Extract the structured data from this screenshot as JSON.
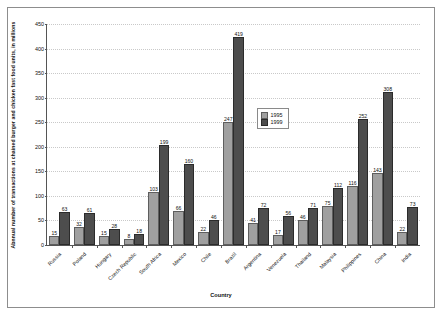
{
  "chart_data": {
    "type": "bar",
    "title": "",
    "xlabel": "Country",
    "ylabel": "Abnnual number of transactions at chained burger and chicken fast food units, in millions",
    "ylim": [
      0,
      450
    ],
    "ytick_step": 50,
    "yticks": [
      "0",
      "50",
      "100",
      "150",
      "200",
      "250",
      "300",
      "350",
      "400",
      "450"
    ],
    "grid": true,
    "legend_position": "inside-right-upper",
    "categories": [
      "Russia",
      "Poland",
      "Hungary",
      "Czech Republic",
      "South Africa",
      "Mexico",
      "Chile",
      "Brazil",
      "Argentina",
      "Venezuela",
      "Thailand",
      "Malaysia",
      "Philippines",
      "China",
      "India"
    ],
    "series": [
      {
        "name": "1995",
        "color": "#a0a0a0",
        "values": [
          15,
          32,
          15,
          8,
          103,
          66,
          22,
          247,
          41,
          17,
          46,
          75,
          116,
          143,
          22
        ]
      },
      {
        "name": "1999",
        "color": "#4d4d4d",
        "values": [
          63,
          61,
          28,
          18,
          199,
          160,
          46,
          419,
          72,
          56,
          71,
          112,
          252,
          308,
          73
        ]
      }
    ]
  },
  "legend": {
    "entries": [
      {
        "label": "1995"
      },
      {
        "label": "1999"
      }
    ]
  }
}
